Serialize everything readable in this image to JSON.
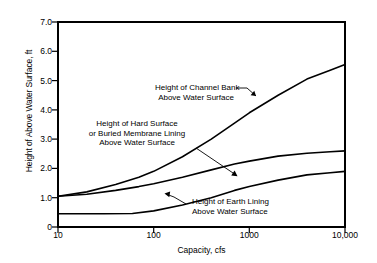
{
  "chart_data": {
    "type": "line",
    "title": "",
    "xlabel": "Capacity, cfs",
    "ylabel": "Height of Above Water Surface, ft",
    "xscale": "log",
    "yscale": "linear",
    "xlim": [
      10,
      10000
    ],
    "ylim": [
      0,
      7.0
    ],
    "grid": false,
    "legend_position": "inline-annotations",
    "x_ticks": [
      {
        "value": 10,
        "label": "10"
      },
      {
        "value": 100,
        "label": "100"
      },
      {
        "value": 1000,
        "label": "1000"
      },
      {
        "value": 10000,
        "label": "10,000"
      }
    ],
    "y_ticks": [
      {
        "value": 0,
        "label": "0"
      },
      {
        "value": 1.0,
        "label": "1.0"
      },
      {
        "value": 2.0,
        "label": "2.0"
      },
      {
        "value": 3.0,
        "label": "3.0"
      },
      {
        "value": 4.0,
        "label": "4.0"
      },
      {
        "value": 5.0,
        "label": "5.0"
      },
      {
        "value": 6.0,
        "label": "6.0"
      },
      {
        "value": 7.0,
        "label": "7.0"
      }
    ],
    "series": [
      {
        "name": "Height of Channel Bank Above Water Surface",
        "color": "#000000",
        "points": [
          [
            10,
            1.05
          ],
          [
            20,
            1.2
          ],
          [
            40,
            1.45
          ],
          [
            70,
            1.7
          ],
          [
            100,
            1.9
          ],
          [
            200,
            2.4
          ],
          [
            400,
            3.0
          ],
          [
            700,
            3.55
          ],
          [
            1000,
            3.9
          ],
          [
            2000,
            4.5
          ],
          [
            4000,
            5.05
          ],
          [
            7000,
            5.35
          ],
          [
            10000,
            5.55
          ]
        ]
      },
      {
        "name": "Height of Hard Surface or Buried Membrane Lining Above Water Surface",
        "color": "#000000",
        "points": [
          [
            10,
            1.05
          ],
          [
            20,
            1.12
          ],
          [
            40,
            1.25
          ],
          [
            70,
            1.38
          ],
          [
            100,
            1.48
          ],
          [
            200,
            1.7
          ],
          [
            400,
            1.95
          ],
          [
            700,
            2.15
          ],
          [
            1000,
            2.25
          ],
          [
            2000,
            2.42
          ],
          [
            4000,
            2.52
          ],
          [
            7000,
            2.57
          ],
          [
            10000,
            2.6
          ]
        ]
      },
      {
        "name": "Height of Earth Lining Above Water Surface",
        "color": "#000000",
        "points": [
          [
            10,
            0.45
          ],
          [
            30,
            0.45
          ],
          [
            60,
            0.46
          ],
          [
            100,
            0.55
          ],
          [
            200,
            0.75
          ],
          [
            400,
            1.0
          ],
          [
            700,
            1.25
          ],
          [
            1000,
            1.38
          ],
          [
            2000,
            1.6
          ],
          [
            4000,
            1.78
          ],
          [
            7000,
            1.85
          ],
          [
            10000,
            1.9
          ]
        ]
      }
    ],
    "annotations": [
      {
        "name": "channel-bank-label",
        "lines": [
          "Height of Channel Bank",
          "Above Water Surface"
        ]
      },
      {
        "name": "hard-surface-label",
        "lines": [
          "Height of Hard Surface",
          "or Buried Membrane Lining",
          "Above Water Surface"
        ]
      },
      {
        "name": "earth-lining-label",
        "lines": [
          "Height of Earth Lining",
          "Above Water Surface"
        ]
      }
    ]
  },
  "axis": {
    "y_title": "Height of Above Water Surface, ft",
    "x_title": "Capacity, cfs",
    "y_tick_labels": [
      "7.0",
      "6.0",
      "5.0",
      "4.0",
      "3.0",
      "2.0",
      "1.0",
      "0"
    ],
    "x_tick_labels": [
      "10",
      "100",
      "1000",
      "10,000"
    ]
  },
  "annotations": {
    "channel_bank": {
      "line1": "Height of Channel Bank",
      "line2": "Above Water Surface"
    },
    "hard_surface": {
      "line1": "Height of Hard Surface",
      "line2": "or Buried Membrane Lining",
      "line3": "Above Water Surface"
    },
    "earth_lining": {
      "line1": "Height of Earth Lining",
      "line2": "Above Water Surface"
    }
  },
  "colors": {
    "curve": "#000000",
    "axis": "#000000",
    "background": "#ffffff"
  }
}
